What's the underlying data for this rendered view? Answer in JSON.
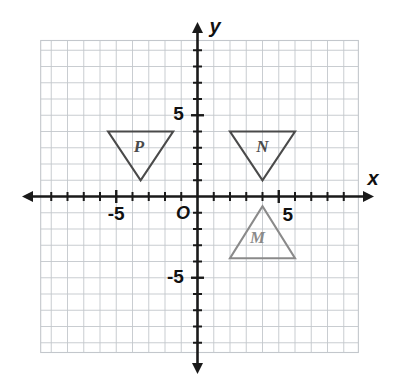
{
  "figure": {
    "background_color": "#ffffff",
    "grid_color": "#c3c7cc",
    "axis_color": "#1a1a1a",
    "label_color": "#111111"
  },
  "axes": {
    "x_label": "x",
    "y_label": "y",
    "origin_label": "O",
    "x_tick_labels": [
      {
        "text": "-5",
        "value": -5
      },
      {
        "text": "5",
        "value": 5
      }
    ],
    "y_tick_labels": [
      {
        "text": "5",
        "value": 5
      },
      {
        "text": "-5",
        "value": -5
      }
    ]
  },
  "chart_data": {
    "type": "scatter",
    "xlabel": "x",
    "ylabel": "y",
    "xlim": [
      -9.6,
      9.9
    ],
    "ylim": [
      -9.6,
      9.6
    ],
    "grid": true,
    "grid_step": 1,
    "major_tick_step": 1,
    "legend": "none",
    "origin_label": "O",
    "x_tick_labels": [
      "-5",
      "5"
    ],
    "y_tick_labels": [
      "5",
      "-5"
    ],
    "shapes": [
      {
        "name": "P",
        "label": "P",
        "type": "triangle",
        "orientation": "pointing-down",
        "color": "#4a4a4a",
        "vertices": [
          [
            -5.5,
            4
          ],
          [
            -1.5,
            4
          ],
          [
            -3.5,
            1
          ]
        ],
        "label_position": [
          -3.6,
          3.0
        ]
      },
      {
        "name": "N",
        "label": "N",
        "type": "triangle",
        "orientation": "pointing-down",
        "color": "#4a4a4a",
        "vertices": [
          [
            2,
            4
          ],
          [
            6,
            4
          ],
          [
            4,
            1
          ]
        ],
        "label_position": [
          4.0,
          3.0
        ]
      },
      {
        "name": "M",
        "label": "M",
        "type": "triangle",
        "orientation": "pointing-up",
        "color": "#8a8a8a",
        "vertices": [
          [
            2,
            -3.8
          ],
          [
            6,
            -3.8
          ],
          [
            4,
            -0.6
          ]
        ],
        "label_position": [
          3.7,
          -2.6
        ]
      }
    ]
  }
}
